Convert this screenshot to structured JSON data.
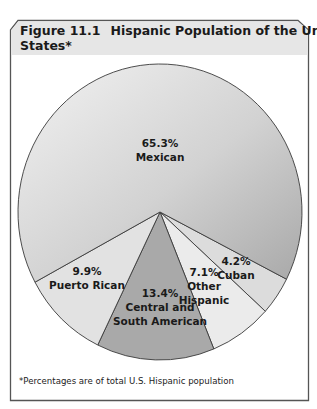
{
  "figure": {
    "number": "Figure 11.1",
    "title_line1": "Hispanic Population of the United",
    "title_line2": "States*",
    "footnote": "*Percentages are of total U.S. Hispanic population",
    "header_bg": "#e6e6e6",
    "border_color": "#555555"
  },
  "chart_data": {
    "type": "pie",
    "categories": [
      "Mexican",
      "Cuban",
      "Other Hispanic",
      "Central and South American",
      "Puerto Rican"
    ],
    "values": [
      65.3,
      4.2,
      7.1,
      13.4,
      9.9
    ],
    "units": "%",
    "slices": [
      {
        "name": "Mexican",
        "value": 65.3,
        "pct_label": "65.3%",
        "label_lines": [
          "Mexican"
        ],
        "color": "#cfcfcf"
      },
      {
        "name": "Cuban",
        "value": 4.2,
        "pct_label": "4.2%",
        "label_lines": [
          "Cuban"
        ],
        "color": "#dcdcdc"
      },
      {
        "name": "Other Hispanic",
        "value": 7.1,
        "pct_label": "7.1%",
        "label_lines": [
          "Other",
          "Hispanic"
        ],
        "color": "#ebebeb"
      },
      {
        "name": "Central and South American",
        "value": 13.4,
        "pct_label": "13.4%",
        "label_lines": [
          "Central and",
          "South American"
        ],
        "color": "#a9a9a9"
      },
      {
        "name": "Puerto Rican",
        "value": 9.9,
        "pct_label": "9.9%",
        "label_lines": [
          "Puerto Rican"
        ],
        "color": "#e2e2e2"
      }
    ],
    "legend": "none (labels inside slices)",
    "footnote": "*Percentages are of total U.S. Hispanic population"
  }
}
